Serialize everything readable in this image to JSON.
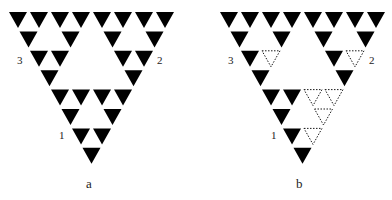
{
  "figure": {
    "colors": {
      "filled": "#000000",
      "outline": "#000000",
      "background": "#ffffff"
    },
    "geometry": {
      "rows": 8,
      "pitch_x": 21,
      "row_step": 19.4,
      "tri_w": 18,
      "tri_h": 16,
      "top_y": 12
    },
    "panels": [
      {
        "id": "a",
        "caption": "a",
        "origin_x": 9,
        "caption_pos": [
          86,
          177
        ],
        "labels": [
          {
            "text": "3",
            "x": 17,
            "y": 55
          },
          {
            "text": "2",
            "x": 157,
            "y": 55
          },
          {
            "text": "1",
            "x": 59,
            "y": 130
          }
        ],
        "dashed": []
      },
      {
        "id": "b",
        "caption": "b",
        "origin_x": 220,
        "caption_pos": [
          296,
          177
        ],
        "labels": [
          {
            "text": "3",
            "x": 228,
            "y": 55
          },
          {
            "text": "2",
            "x": 369,
            "y": 55
          },
          {
            "text": "1",
            "x": 271,
            "y": 130
          }
        ],
        "dashed": [
          [
            2,
            1
          ],
          [
            2,
            5
          ],
          [
            4,
            2
          ],
          [
            4,
            3
          ],
          [
            5,
            2
          ],
          [
            6,
            1
          ]
        ]
      }
    ]
  }
}
